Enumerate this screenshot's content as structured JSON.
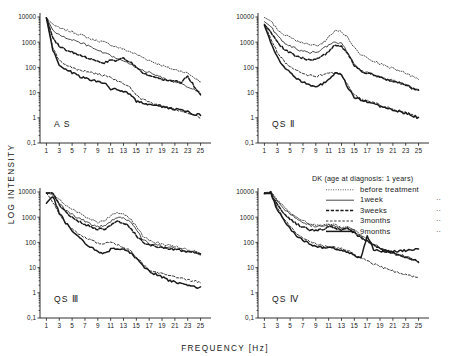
{
  "figure": {
    "xlabel": "FREQUENCY [Hz]",
    "ylabel": "LOG INTENSITY"
  },
  "legend": {
    "title": "DK (age at diagnosis: 1 years)",
    "entries": [
      {
        "label": "before treatment",
        "style": "dotted",
        "mark": ""
      },
      {
        "label": "1week",
        "style": "solid-thin",
        "mark": "··"
      },
      {
        "label": "3weeks",
        "style": "dashdot",
        "mark": "··"
      },
      {
        "label": "3months",
        "style": "dashed",
        "mark": "··"
      },
      {
        "label": "9months",
        "style": "solid-thick",
        "mark": "··"
      }
    ]
  },
  "chart_data": {
    "type": "line",
    "title": "",
    "xlabel": "FREQUENCY [Hz]",
    "ylabel": "LOG INTENSITY",
    "xlim": [
      0,
      26
    ],
    "ylim": [
      0.1,
      10000
    ],
    "yscale": "log",
    "yticks": [
      10000,
      1000,
      100,
      10,
      1,
      0.1
    ],
    "ytick_labels": [
      "10000",
      "1000",
      "100",
      "10",
      "1",
      "0,1"
    ],
    "xticks": [
      1,
      3,
      5,
      7,
      9,
      11,
      13,
      15,
      17,
      19,
      21,
      23,
      25
    ],
    "grid": false,
    "legend_position": "bottom-right-panel",
    "panels": [
      {
        "name": "AS",
        "label": "A S",
        "position": "top-left",
        "x": [
          1,
          2,
          3,
          4,
          5,
          6,
          7,
          8,
          9,
          10,
          11,
          12,
          13,
          14,
          15,
          16,
          17,
          18,
          19,
          20,
          21,
          22,
          23,
          24,
          25
        ],
        "series": [
          {
            "name": "before treatment",
            "style": "dotted",
            "values": [
              9000,
              5200,
              3600,
              3000,
              2600,
              2100,
              1700,
              1300,
              1150,
              1000,
              780,
              640,
              520,
              420,
              330,
              250,
              190,
              150,
              120,
              95,
              80,
              72,
              58,
              40,
              26
            ]
          },
          {
            "name": "1week",
            "style": "solid-thin",
            "values": [
              9500,
              3000,
              1900,
              1500,
              1250,
              1000,
              820,
              620,
              470,
              360,
              290,
              230,
              175,
              135,
              100,
              78,
              62,
              50,
              40,
              32,
              26,
              21,
              17,
              13,
              9
            ]
          },
          {
            "name": "3weeks",
            "style": "dashdot",
            "values": [
              9200,
              1500,
              700,
              500,
              400,
              330,
              270,
              210,
              170,
              150,
              200,
              180,
              230,
              170,
              95,
              62,
              46,
              38,
              33,
              30,
              28,
              26,
              44,
              18,
              8
            ]
          },
          {
            "name": "3months",
            "style": "dashed",
            "values": [
              9000,
              600,
              190,
              130,
              100,
              78,
              70,
              62,
              55,
              48,
              40,
              30,
              22,
              16,
              8,
              5.2,
              4.2,
              3.6,
              3.0,
              2.6,
              2.2,
              1.9,
              1.6,
              1.3,
              1.0
            ]
          },
          {
            "name": "9months",
            "style": "solid-thick",
            "values": [
              9200,
              480,
              130,
              85,
              62,
              45,
              38,
              32,
              28,
              24,
              14,
              13,
              11,
              9,
              4.6,
              4.0,
              3.4,
              3.2,
              2.8,
              2.5,
              2.2,
              2.0,
              1.7,
              1.4,
              1.3
            ]
          }
        ]
      },
      {
        "name": "QS II",
        "label": "QS Ⅱ",
        "position": "top-right",
        "x": [
          1,
          2,
          3,
          4,
          5,
          6,
          7,
          8,
          9,
          10,
          11,
          12,
          13,
          14,
          15,
          16,
          17,
          18,
          19,
          20,
          21,
          22,
          23,
          24,
          25
        ],
        "series": [
          {
            "name": "before treatment",
            "style": "dotted",
            "values": [
              9500,
              7000,
              3200,
              2100,
              1500,
              1150,
              900,
              800,
              750,
              850,
              1600,
              3000,
              2600,
              1500,
              600,
              320,
              230,
              180,
              140,
              110,
              90,
              72,
              58,
              45,
              33
            ]
          },
          {
            "name": "1week",
            "style": "solid-thin",
            "values": [
              6500,
              4200,
              1800,
              1000,
              700,
              540,
              430,
              390,
              400,
              520,
              750,
              1000,
              900,
              400,
              130,
              72,
              60,
              52,
              42,
              35,
              30,
              25,
              20,
              16,
              13
            ]
          },
          {
            "name": "3weeks",
            "style": "dashdot",
            "values": [
              5000,
              2600,
              1000,
              560,
              370,
              280,
              230,
              200,
              210,
              280,
              420,
              800,
              700,
              340,
              120,
              70,
              58,
              50,
              41,
              34,
              29,
              24,
              19,
              15,
              12
            ]
          },
          {
            "name": "3months",
            "style": "dashed",
            "values": [
              5200,
              1400,
              400,
              180,
              110,
              75,
              58,
              48,
              44,
              50,
              58,
              58,
              52,
              20,
              8,
              5.5,
              4.6,
              4.0,
              3.2,
              2.6,
              2.2,
              1.9,
              1.7,
              1.3,
              1.1
            ]
          },
          {
            "name": "9months",
            "style": "solid-thick",
            "values": [
              4600,
              1000,
              260,
              110,
              60,
              38,
              26,
              20,
              16,
              22,
              32,
              58,
              50,
              16,
              6.5,
              5.0,
              4.4,
              3.6,
              2.9,
              2.4,
              2.0,
              1.8,
              1.5,
              1.2,
              1.0
            ]
          }
        ]
      },
      {
        "name": "QS III",
        "label": "QS Ⅲ",
        "position": "bottom-left",
        "x": [
          1,
          2,
          3,
          4,
          5,
          6,
          7,
          8,
          9,
          10,
          11,
          12,
          13,
          14,
          15,
          16,
          17,
          18,
          19,
          20,
          21,
          22,
          23,
          24,
          25
        ],
        "series": [
          {
            "name": "before treatment",
            "style": "dotted",
            "values": [
              9500,
              9000,
              5000,
              3000,
              2000,
              1500,
              1100,
              800,
              620,
              700,
              1200,
              1500,
              1400,
              900,
              420,
              180,
              120,
              100,
              85,
              75,
              68,
              60,
              52,
              44,
              36
            ]
          },
          {
            "name": "1week",
            "style": "solid-thin",
            "values": [
              9200,
              8000,
              3400,
              2000,
              1300,
              900,
              700,
              520,
              420,
              450,
              700,
              1000,
              900,
              700,
              330,
              130,
              90,
              78,
              70,
              64,
              58,
              52,
              46,
              40,
              34
            ]
          },
          {
            "name": "3weeks",
            "style": "dashdot",
            "values": [
              9000,
              9500,
              3000,
              1600,
              1000,
              700,
              520,
              400,
              330,
              340,
              450,
              700,
              620,
              400,
              190,
              100,
              78,
              68,
              62,
              58,
              54,
              48,
              42,
              38,
              33
            ]
          },
          {
            "name": "3months",
            "style": "dashed",
            "values": [
              9200,
              4000,
              1300,
              600,
              330,
              220,
              160,
              120,
              95,
              90,
              100,
              80,
              62,
              48,
              28,
              14,
              8,
              6.5,
              5.5,
              4.8,
              4.2,
              3.6,
              3.2,
              2.9,
              2.7
            ]
          },
          {
            "name": "9months",
            "style": "solid-thick",
            "values": [
              3600,
              7000,
              1500,
              600,
              300,
              160,
              95,
              62,
              42,
              36,
              52,
              60,
              52,
              40,
              24,
              12,
              7,
              5.5,
              4.2,
              3.2,
              2.6,
              2.2,
              1.9,
              1.7,
              1.6
            ]
          }
        ]
      },
      {
        "name": "QS IV",
        "label": "QS Ⅳ",
        "position": "bottom-right",
        "x": [
          1,
          2,
          3,
          4,
          5,
          6,
          7,
          8,
          9,
          10,
          11,
          12,
          13,
          14,
          15,
          16,
          17,
          18,
          19,
          20,
          21,
          22,
          23,
          24,
          25
        ],
        "series": [
          {
            "name": "before treatment",
            "style": "dotted",
            "values": [
              9500,
              10000,
              5000,
              2600,
              1500,
              1000,
              750,
              560,
              480,
              500,
              560,
              480,
              400,
              420,
              300,
              200,
              130,
              90,
              62,
              48,
              40,
              33,
              28,
              22,
              17
            ]
          },
          {
            "name": "1week",
            "style": "solid-thin",
            "values": [
              9000,
              9500,
              4200,
              2200,
              1300,
              900,
              650,
              480,
              420,
              440,
              480,
              420,
              360,
              380,
              280,
              170,
              110,
              80,
              58,
              46,
              38,
              32,
              27,
              22,
              18
            ]
          },
          {
            "name": "3weeks",
            "style": "dashdot",
            "values": [
              8500,
              9500,
              3000,
              1400,
              800,
              540,
              400,
              320,
              300,
              330,
              420,
              380,
              330,
              340,
              240,
              150,
              110,
              78,
              56,
              44,
              37,
              31,
              26,
              21,
              17
            ]
          },
          {
            "name": "3months",
            "style": "dashed",
            "values": [
              9200,
              9000,
              2400,
              900,
              420,
              230,
              150,
              110,
              85,
              75,
              70,
              62,
              56,
              46,
              34,
              24,
              18,
              14,
              11,
              9,
              7.5,
              6.2,
              5.2,
              4.6,
              4.2
            ]
          },
          {
            "name": "9months",
            "style": "solid-thick",
            "values": [
              9000,
              8500,
              2000,
              750,
              340,
              180,
              120,
              88,
              70,
              62,
              60,
              56,
              50,
              42,
              30,
              24,
              170,
              52,
              46,
              44,
              44,
              46,
              48,
              50,
              52
            ]
          }
        ]
      }
    ]
  }
}
